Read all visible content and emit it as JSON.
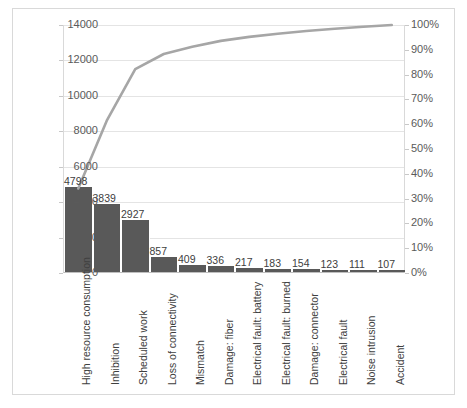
{
  "chart_data": {
    "type": "bar",
    "title": "",
    "subtitle": "",
    "xlabel": "",
    "ylabel": "",
    "grid": true,
    "legend": "none",
    "categories": [
      "High resource consumption",
      "Inhibition",
      "Scheduled work",
      "Loss of connectivity",
      "Mismatch",
      "Damage: fiber",
      "Electrical fault: battery",
      "Electrical fault: burned",
      "Damage: connector",
      "Electrical fault",
      "Noise intrusion",
      "Accident"
    ],
    "series": [
      {
        "name": "Count",
        "type": "bar",
        "axis": "left",
        "values": [
          4798,
          3839,
          2927,
          857,
          409,
          336,
          217,
          183,
          154,
          123,
          111,
          107
        ]
      },
      {
        "name": "Cumulative percentage",
        "type": "line",
        "axis": "right",
        "values": [
          34.1,
          61.4,
          82.2,
          88.3,
          91.2,
          93.6,
          95.2,
          96.5,
          97.6,
          98.5,
          99.3,
          100.0
        ]
      }
    ],
    "bar_labels": [
      "4798",
      "3839",
      "2927",
      "857",
      "409",
      "336",
      "217",
      "183",
      "154",
      "123",
      "111",
      "107"
    ],
    "ylim": [
      0,
      14000
    ],
    "ylim_right": [
      0,
      100
    ],
    "yticks_left": [
      "0",
      "2000",
      "4000",
      "6000",
      "8000",
      "10000",
      "12000",
      "14000"
    ],
    "yticks_right": [
      "0%",
      "10%",
      "20%",
      "30%",
      "40%",
      "50%",
      "60%",
      "70%",
      "80%",
      "90%",
      "100%"
    ],
    "colors": {
      "bar": "#595959",
      "line": "#a6a6a6",
      "grid": "#e4e4e4",
      "axis": "#bfbfbf",
      "text": "#404040",
      "background": "#ffffff"
    }
  }
}
